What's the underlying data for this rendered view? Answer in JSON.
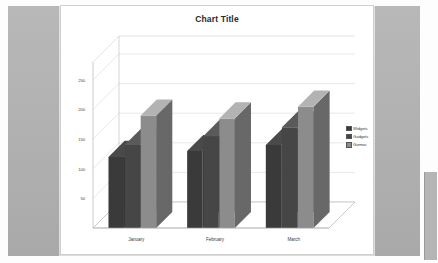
{
  "chart_data": {
    "type": "bar",
    "title": "Chart Title",
    "xlabel": "",
    "ylabel": "",
    "categories": [
      "January",
      "February",
      "March"
    ],
    "series": [
      {
        "name": "Widgets",
        "values": [
          120,
          130,
          140
        ],
        "color": "#3a3a3a"
      },
      {
        "name": "Gadgets",
        "values": [
          140,
          155,
          170
        ],
        "color": "#464646"
      },
      {
        "name": "Gizmos",
        "values": [
          190,
          185,
          205
        ],
        "color": "#8c8c8c"
      }
    ],
    "ylim": [
      0,
      250
    ],
    "yticks": [
      50,
      100,
      150,
      200,
      250
    ],
    "ytick_labels": [
      "50",
      "100",
      "150",
      "200",
      "250"
    ],
    "grid": true,
    "grid_axis": "y",
    "legend_position": "right",
    "three_d": true
  },
  "colors": {
    "page_background": "#b2b2b2",
    "chart_background": "#ffffff",
    "gridline": "#d0d0d0",
    "axis_line": "#a8a8a8",
    "floor": "#ffffff",
    "title_text": "#2a2a2a",
    "tick_text": "#4a4a4a"
  }
}
